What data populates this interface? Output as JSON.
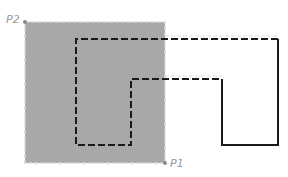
{
  "diagram": {
    "selection": {
      "corner_start_label": "P1",
      "corner_end_label": "P2",
      "fill": "#a8a8a8",
      "border": "#d0d0d0"
    },
    "shape": {
      "stroke": "#1a1a1a"
    }
  }
}
